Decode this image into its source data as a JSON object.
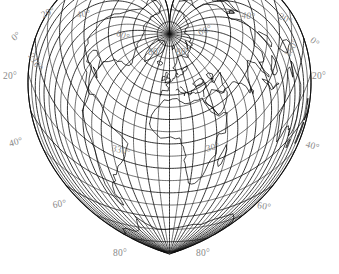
{
  "figure": {
    "name": "world-map-cordiform",
    "projection_type": "Werner cordiform equal-area projection",
    "width": 339,
    "height": 274,
    "background_color": "#ffffff",
    "line_color": "#000000",
    "label_color": "#8a8a8a"
  },
  "chart_data": {
    "type": "map",
    "projection": "werner-cordiform",
    "title": "",
    "graticule_interval_deg": 10,
    "labelled_interval_deg": 20,
    "central_meridian_deg": 0,
    "standard_parallel_deg": 90,
    "grid": true,
    "legend": "none",
    "latitude_range": [
      -90,
      90
    ],
    "longitude_range": [
      -180,
      180
    ],
    "labels": [
      {
        "text": "20°",
        "kind": "longitude",
        "value": -20,
        "x": 40,
        "y": 12,
        "rotate": -26
      },
      {
        "text": "40°",
        "kind": "longitude",
        "value": -40,
        "x": 76,
        "y": 11,
        "rotate": -8
      },
      {
        "text": "60°",
        "kind": "longitude",
        "value": -60,
        "x": 118,
        "y": 29,
        "rotate": 22
      },
      {
        "text": "80°",
        "kind": "longitude",
        "value": -80,
        "x": 148,
        "y": 48,
        "rotate": 0
      },
      {
        "text": "0°",
        "kind": "longitude",
        "value": 0,
        "x": 10,
        "y": 36,
        "rotate": -40
      },
      {
        "text": "210°",
        "kind": "longitude",
        "value": -150,
        "x": 34,
        "y": 52,
        "rotate": 58
      },
      {
        "text": "20°",
        "kind": "latitude",
        "value": 20,
        "x": 3,
        "y": 72,
        "rotate": 0
      },
      {
        "text": "330°",
        "kind": "longitude",
        "value": -30,
        "x": 113,
        "y": 144,
        "rotate": 14
      },
      {
        "text": "40°",
        "kind": "latitude",
        "value": -20,
        "x": 8,
        "y": 140,
        "rotate": -16
      },
      {
        "text": "60°",
        "kind": "latitude",
        "value": -50,
        "x": 52,
        "y": 201,
        "rotate": -10
      },
      {
        "text": "80°",
        "kind": "latitude",
        "value": -80,
        "x": 113,
        "y": 249,
        "rotate": 0
      },
      {
        "text": "40°",
        "kind": "longitude",
        "value": 40,
        "x": 242,
        "y": 11,
        "rotate": 8
      },
      {
        "text": "20°",
        "kind": "longitude",
        "value": 20,
        "x": 281,
        "y": 12,
        "rotate": 26
      },
      {
        "text": "60°",
        "kind": "longitude",
        "value": 60,
        "x": 197,
        "y": 29,
        "rotate": -22
      },
      {
        "text": "80°",
        "kind": "longitude",
        "value": 80,
        "x": 176,
        "y": 48,
        "rotate": 0
      },
      {
        "text": "0°",
        "kind": "longitude",
        "value": 0,
        "x": 314,
        "y": 36,
        "rotate": 40
      },
      {
        "text": "150°",
        "kind": "longitude",
        "value": 150,
        "x": 283,
        "y": 54,
        "rotate": -58
      },
      {
        "text": "20°",
        "kind": "latitude",
        "value": 20,
        "x": 312,
        "y": 72,
        "rotate": 0
      },
      {
        "text": "30°",
        "kind": "longitude",
        "value": 30,
        "x": 205,
        "y": 145,
        "rotate": -14
      },
      {
        "text": "40°",
        "kind": "latitude",
        "value": -20,
        "x": 307,
        "y": 140,
        "rotate": 16
      },
      {
        "text": "60°",
        "kind": "latitude",
        "value": -50,
        "x": 258,
        "y": 201,
        "rotate": 10
      },
      {
        "text": "80°",
        "kind": "latitude",
        "value": -80,
        "x": 196,
        "y": 249,
        "rotate": 0
      }
    ]
  }
}
